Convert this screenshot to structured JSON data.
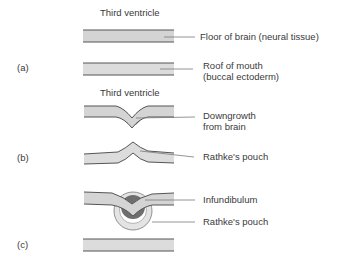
{
  "diagram": {
    "colors": {
      "tissue_fill": "#d6d6d6",
      "tissue_outline": "#5a5a5a",
      "downgrowth_fill": "#7a7a7a",
      "pouch_fill": "#e6e6e6",
      "leader_line": "#7a7a7a"
    },
    "panels": [
      {
        "id": "a",
        "label": "(a)",
        "top_caption": "Third ventricle",
        "annotations": [
          {
            "text": "Floor of brain (neural tissue)"
          },
          {
            "text": "Roof of mouth",
            "text2": "(buccal ectoderm)"
          }
        ]
      },
      {
        "id": "b",
        "label": "(b)",
        "top_caption": "Third ventricle",
        "annotations": [
          {
            "text": "Downgrowth",
            "text2": "from brain"
          },
          {
            "text": "Rathke's pouch"
          }
        ]
      },
      {
        "id": "c",
        "label": "(c)",
        "annotations": [
          {
            "text": "Infundibulum"
          },
          {
            "text": "Rathke's pouch"
          }
        ]
      }
    ]
  }
}
